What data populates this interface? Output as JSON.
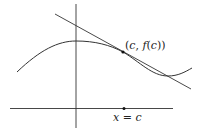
{
  "diagram": {
    "type": "tangent-line-illustration",
    "point_label": "(c, f(c))",
    "point_label_parts": {
      "open": "(",
      "c": "c",
      "comma": ", ",
      "f": "f",
      "inner_open": "(",
      "c2": "c",
      "close": "))"
    },
    "x_marker_label": "x = c",
    "x_marker_parts": {
      "x": "x",
      "eq": " = ",
      "c": "c"
    },
    "colors": {
      "stroke": "#333333",
      "point": "#111111",
      "background": "#ffffff"
    }
  }
}
